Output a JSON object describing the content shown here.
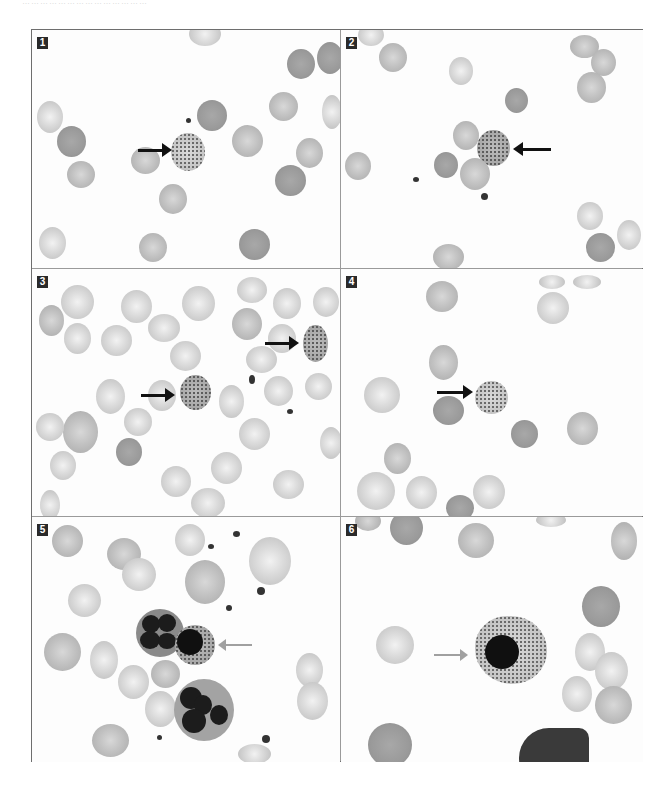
{
  "page": {
    "top_text_fragment": "……………………………………"
  },
  "figure": {
    "panels": [
      {
        "label": "1",
        "description": "Red cell with basophilic stippling",
        "arrows": [
          {
            "direction": "right",
            "color": "black"
          }
        ]
      },
      {
        "label": "2",
        "description": "Stippled red cell",
        "arrows": [
          {
            "direction": "left",
            "color": "black"
          }
        ]
      },
      {
        "label": "3",
        "description": "Two stippled red cells",
        "arrows": [
          {
            "direction": "right",
            "color": "black"
          },
          {
            "direction": "right",
            "color": "black"
          }
        ]
      },
      {
        "label": "4",
        "description": "Stippled red cell",
        "arrows": [
          {
            "direction": "right",
            "color": "black"
          }
        ]
      },
      {
        "label": "5",
        "description": "Nucleated red cell with stippled cytoplasm beside neutrophils",
        "arrows": [
          {
            "direction": "left",
            "color": "grey"
          }
        ]
      },
      {
        "label": "6",
        "description": "Nucleated red cell (normoblast) with stippled cytoplasm",
        "arrows": [
          {
            "direction": "right",
            "color": "grey"
          }
        ]
      }
    ]
  }
}
